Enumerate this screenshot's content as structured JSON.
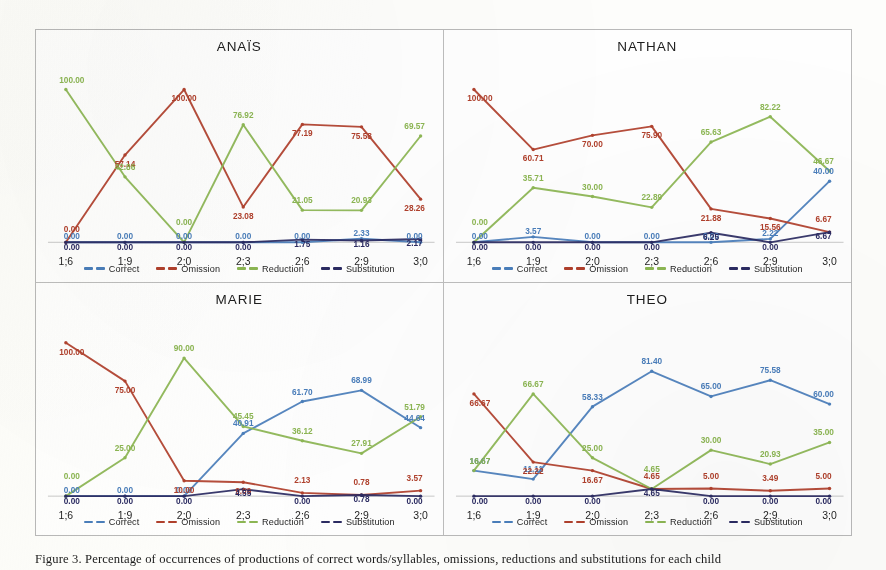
{
  "figure": {
    "caption": "Figure 3. Percentage of occurrences of productions of correct words/syllables, omissions, reductions and substitutions for each child",
    "series_names": [
      "Correct",
      "Omission",
      "Reduction",
      "Substitution"
    ],
    "colors": {
      "correct": "#4a7ebb",
      "omission": "#b0402c",
      "reduction": "#8cb653",
      "substitution": "#2b2b62",
      "axis": "#c9c9c9",
      "panel_border": "#bdbdbd"
    },
    "legend_items": [
      {
        "label": "Correct",
        "color": "#4a7ebb"
      },
      {
        "label": "Omission",
        "color": "#b0402c"
      },
      {
        "label": "Reduction",
        "color": "#8cb653"
      },
      {
        "label": "Substitution",
        "color": "#2b2b62"
      }
    ]
  },
  "chart_data": [
    {
      "type": "line",
      "title": "ANAÏS",
      "xlabel": "",
      "ylabel": "",
      "ylim": [
        0,
        100
      ],
      "grid": false,
      "legend_position": "bottom",
      "categories": [
        "1;6",
        "1;9",
        "2;0",
        "2;3",
        "2;6",
        "2;9",
        "3;0"
      ],
      "series": [
        {
          "name": "Correct",
          "color": "#4a7ebb",
          "values": [
            0.0,
            0.0,
            0.0,
            0.0,
            0.0,
            2.33,
            0.0
          ],
          "labels": [
            "0.00",
            "0.00",
            "0.00",
            "0.00",
            "0.00",
            "2.33",
            "0.00"
          ]
        },
        {
          "name": "Omission",
          "color": "#b0402c",
          "values": [
            0.0,
            57.14,
            100.0,
            23.08,
            77.19,
            75.58,
            28.26
          ],
          "labels": [
            "0.00",
            "57.14",
            "100.00",
            "23.08",
            "77.19",
            "75.58",
            "28.26"
          ]
        },
        {
          "name": "Reduction",
          "color": "#8cb653",
          "values": [
            100.0,
            42.86,
            0.0,
            76.92,
            21.05,
            20.93,
            69.57
          ],
          "labels": [
            "100.00",
            "42.86",
            "0.00",
            "76.92",
            "21.05",
            "20.93",
            "69.57"
          ]
        },
        {
          "name": "Substitution",
          "color": "#2b2b62",
          "values": [
            0.0,
            0.0,
            0.0,
            0.0,
            1.75,
            1.16,
            2.17
          ],
          "labels": [
            "0.00",
            "0.00",
            "0.00",
            "0.00",
            "1.75",
            "1.16",
            "2.17"
          ]
        }
      ]
    },
    {
      "type": "line",
      "title": "NATHAN",
      "xlabel": "",
      "ylabel": "",
      "ylim": [
        0,
        100
      ],
      "grid": false,
      "legend_position": "bottom",
      "categories": [
        "1;6",
        "1;9",
        "2;0",
        "2;3",
        "2;6",
        "2;9",
        "3;0"
      ],
      "series": [
        {
          "name": "Correct",
          "color": "#4a7ebb",
          "values": [
            0.0,
            3.57,
            0.0,
            0.0,
            0.0,
            2.22,
            40.0
          ],
          "labels": [
            "0.00",
            "3.57",
            "0.00",
            "0.00",
            "0.00",
            "2.22",
            "40.00"
          ]
        },
        {
          "name": "Omission",
          "color": "#b0402c",
          "values": [
            100.0,
            60.71,
            70.0,
            75.9,
            21.88,
            15.56,
            6.67
          ],
          "labels": [
            "100.00",
            "60.71",
            "70.00",
            "75.90",
            "21.88",
            "15.56",
            "6.67"
          ]
        },
        {
          "name": "Reduction",
          "color": "#8cb653",
          "values": [
            0.0,
            35.71,
            30.0,
            22.89,
            65.63,
            82.22,
            46.67
          ],
          "labels": [
            "0.00",
            "35.71",
            "30.00",
            "22.89",
            "65.63",
            "82.22",
            "46.67"
          ]
        },
        {
          "name": "Substitution",
          "color": "#2b2b62",
          "values": [
            0.0,
            0.0,
            0.0,
            0.0,
            6.25,
            0.0,
            6.67
          ],
          "labels": [
            "0.00",
            "0.00",
            "0.00",
            "0.00",
            "6.25",
            "0.00",
            "6.67"
          ]
        }
      ]
    },
    {
      "type": "line",
      "title": "MARIE",
      "xlabel": "",
      "ylabel": "",
      "ylim": [
        0,
        100
      ],
      "grid": false,
      "legend_position": "bottom",
      "categories": [
        "1;6",
        "1;9",
        "2;0",
        "2;3",
        "2;6",
        "2;9",
        "3;0"
      ],
      "series": [
        {
          "name": "Correct",
          "color": "#4a7ebb",
          "values": [
            0.0,
            0.0,
            0.0,
            40.91,
            61.7,
            68.99,
            44.64
          ],
          "labels": [
            "0.00",
            "0.00",
            "0.00",
            "40.91",
            "61.70",
            "68.99",
            "44.64"
          ]
        },
        {
          "name": "Omission",
          "color": "#b0402c",
          "values": [
            100.0,
            75.0,
            10.0,
            9.09,
            2.13,
            0.78,
            3.57
          ],
          "labels": [
            "100.00",
            "75.00",
            "10.00",
            "9.09",
            "2.13",
            "0.78",
            "3.57"
          ]
        },
        {
          "name": "Reduction",
          "color": "#8cb653",
          "values": [
            0.0,
            25.0,
            90.0,
            45.45,
            36.12,
            27.91,
            51.79
          ],
          "labels": [
            "0.00",
            "25.00",
            "90.00",
            "45.45",
            "36.12",
            "27.91",
            "51.79"
          ]
        },
        {
          "name": "Substitution",
          "color": "#2b2b62",
          "values": [
            0.0,
            0.0,
            0.0,
            4.55,
            0.0,
            0.78,
            0.0
          ],
          "labels": [
            "0.00",
            "0.00",
            "0.00",
            "4.55",
            "0.00",
            "0.78",
            "0.00"
          ]
        }
      ]
    },
    {
      "type": "line",
      "title": "THEO",
      "xlabel": "",
      "ylabel": "",
      "ylim": [
        0,
        100
      ],
      "grid": false,
      "legend_position": "bottom",
      "categories": [
        "1;6",
        "1;9",
        "2;0",
        "2;3",
        "2;6",
        "2;9",
        "3;0"
      ],
      "series": [
        {
          "name": "Correct",
          "color": "#4a7ebb",
          "values": [
            16.67,
            11.11,
            58.33,
            81.4,
            65.0,
            75.58,
            60.0
          ],
          "labels": [
            "16.67",
            "11.11",
            "58.33",
            "81.40",
            "65.00",
            "75.58",
            "60.00"
          ]
        },
        {
          "name": "Omission",
          "color": "#b0402c",
          "values": [
            66.67,
            22.22,
            16.67,
            4.65,
            5.0,
            3.49,
            5.0
          ],
          "labels": [
            "66.67",
            "22.22",
            "16.67",
            "4.65",
            "5.00",
            "3.49",
            "5.00"
          ]
        },
        {
          "name": "Reduction",
          "color": "#8cb653",
          "values": [
            16.67,
            66.67,
            25.0,
            4.65,
            30.0,
            20.93,
            35.0
          ],
          "labels": [
            "16.67",
            "66.67",
            "25.00",
            "4.65",
            "30.00",
            "20.93",
            "35.00"
          ]
        },
        {
          "name": "Substitution",
          "color": "#2b2b62",
          "values": [
            0.0,
            0.0,
            0.0,
            4.65,
            0.0,
            0.0,
            0.0
          ],
          "labels": [
            "0.00",
            "0.00",
            "0.00",
            "4.65",
            "0.00",
            "0.00",
            "0.00"
          ]
        }
      ]
    }
  ]
}
